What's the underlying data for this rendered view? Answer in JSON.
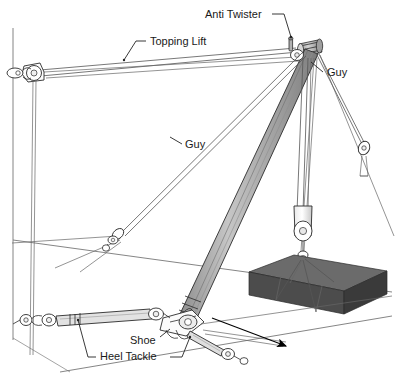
{
  "figure": {
    "kind": "technical-line-diagram",
    "cropped_title_fragment": "",
    "background_color": "#ffffff",
    "line_color": "#2b2b2b",
    "label_text_color": "#1a1a1a"
  },
  "labels": [
    {
      "id": "anti-twister",
      "text": "Anti Twister",
      "x": 205,
      "y": 18,
      "anchor": "start"
    },
    {
      "id": "topping-lift",
      "text": "Topping Lift",
      "x": 150,
      "y": 45,
      "anchor": "start"
    },
    {
      "id": "guy-right",
      "text": "Guy",
      "x": 327,
      "y": 76,
      "anchor": "start"
    },
    {
      "id": "guy-left",
      "text": "Guy",
      "x": 185,
      "y": 148,
      "anchor": "start"
    },
    {
      "id": "shoe",
      "text": "Shoe",
      "x": 130,
      "y": 344,
      "anchor": "start"
    },
    {
      "id": "heel-tackle",
      "text": "Heel Tackle",
      "x": 100,
      "y": 360,
      "anchor": "start"
    }
  ],
  "parts": {
    "boom": {
      "name": "derrick boom",
      "fill_light": "#b9b9b9",
      "fill_dark": "#8a8a8a",
      "outline": "#2b2b2b"
    },
    "mast": {
      "name": "mast head / derrick head",
      "fill_light": "#c9c9c9",
      "fill_dark": "#7d7d7d"
    },
    "load": {
      "name": "rectangular load block",
      "top_face": "#6b6b6b",
      "front_face": "#4c4c4c",
      "end_face": "#3d3d3d"
    },
    "cargo_runner_block": {
      "name": "cargo hook block"
    },
    "heel_tackle": {
      "name": "heel tackle purchase"
    },
    "shoe": {
      "name": "heel shoe / boom step"
    },
    "anti_twister": {
      "name": "anti twister fitting"
    },
    "topping_lift": {
      "name": "topping lift span"
    },
    "guys": {
      "name": "guy pendants",
      "count": 3
    },
    "direction_arrow": {
      "name": "load travel direction arrow",
      "color": "#000000"
    }
  },
  "colors": {
    "boom_light": "#bdbdbd",
    "boom_mid": "#9b9b9b",
    "boom_dark": "#7a7a7a",
    "load_top": "#6b6b6b",
    "load_front": "#4c4c4c",
    "load_end": "#3a3a3a",
    "stroke": "#2b2b2b",
    "rope": "#555555",
    "ground": "#777777"
  }
}
